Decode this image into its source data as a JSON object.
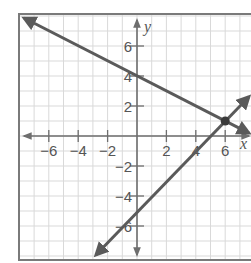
{
  "graph": {
    "x_axis_label": "x",
    "y_axis_label": "y",
    "x_tick_labels": [
      {
        "value": -6,
        "text": "−6"
      },
      {
        "value": -4,
        "text": "−4"
      },
      {
        "value": -2,
        "text": "−2"
      },
      {
        "value": 2,
        "text": "2"
      },
      {
        "value": 4,
        "text": "4"
      },
      {
        "value": 6,
        "text": "6"
      }
    ],
    "y_tick_labels": [
      {
        "value": 6,
        "text": "6"
      },
      {
        "value": 4,
        "text": "4"
      },
      {
        "value": 2,
        "text": "2"
      },
      {
        "value": -2,
        "text": "−2"
      },
      {
        "value": -4,
        "text": "−4"
      },
      {
        "value": -6,
        "text": "−6"
      }
    ],
    "colors": {
      "grid": "#d9d9d9",
      "axes": "#6e6e6e",
      "lines": "#5a5a5a",
      "frame": "#7a7a7a"
    }
  },
  "chart_data": {
    "type": "line",
    "title": "",
    "xlabel": "x",
    "ylabel": "y",
    "xlim": [
      -8,
      8
    ],
    "ylim": [
      -8,
      8
    ],
    "grid": true,
    "series": [
      {
        "name": "line 1",
        "equation": "y = -x/2 + 4",
        "points": [
          [
            -8,
            8
          ],
          [
            0,
            4
          ],
          [
            6,
            1
          ],
          [
            8,
            0
          ]
        ]
      },
      {
        "name": "line 2",
        "equation": "y = x - 5",
        "points": [
          [
            -3,
            -8
          ],
          [
            0,
            -5
          ],
          [
            6,
            1
          ],
          [
            8,
            3
          ]
        ]
      }
    ],
    "intersection": {
      "x": 6,
      "y": 1
    }
  }
}
